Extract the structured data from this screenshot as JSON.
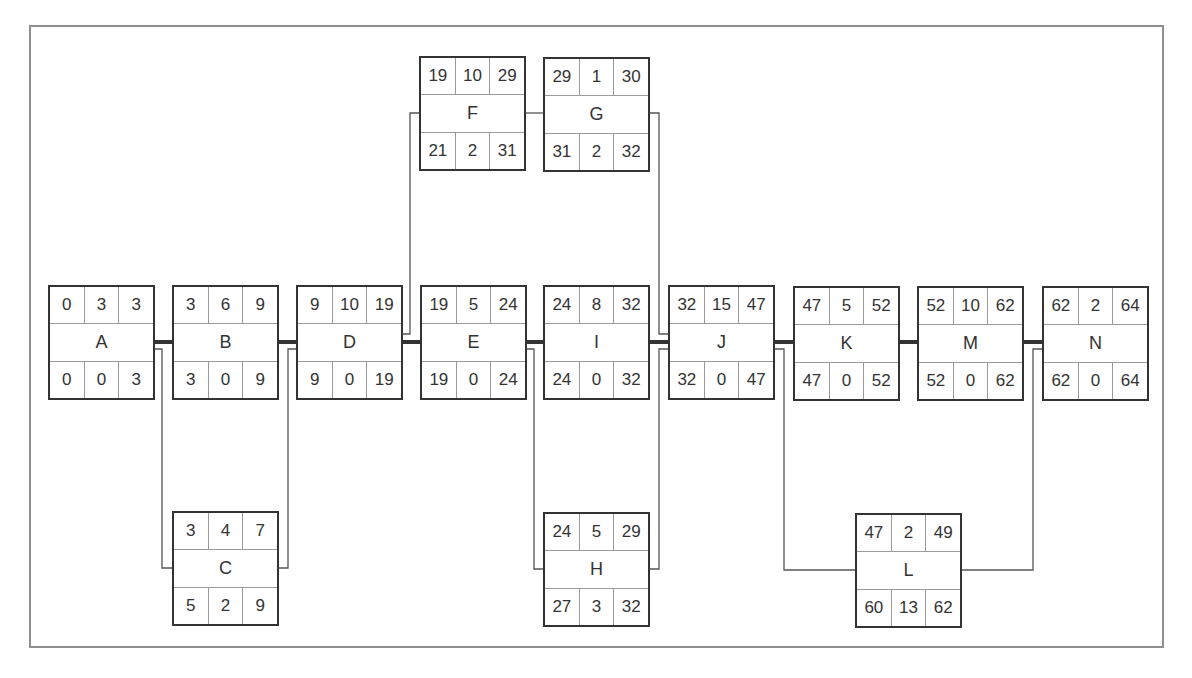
{
  "diagram": {
    "type": "activity-on-node network (critical path)",
    "cell_layout": {
      "top_row": [
        "early_start",
        "duration",
        "early_finish"
      ],
      "middle_row": "activity",
      "bottom_row": [
        "late_start",
        "total_float",
        "late_finish"
      ]
    },
    "colors": {
      "frame": "#8e8e8e",
      "node_border": "#333333",
      "cell_divider": "#9a9a9a",
      "critical_link": "#333333",
      "noncritical_link": "#555555"
    }
  },
  "nodes": {
    "A": {
      "label": "A",
      "es": "0",
      "dur": "3",
      "ef": "3",
      "ls": "0",
      "tf": "0",
      "lf": "3"
    },
    "B": {
      "label": "B",
      "es": "3",
      "dur": "6",
      "ef": "9",
      "ls": "3",
      "tf": "0",
      "lf": "9"
    },
    "C": {
      "label": "C",
      "es": "3",
      "dur": "4",
      "ef": "7",
      "ls": "5",
      "tf": "2",
      "lf": "9"
    },
    "D": {
      "label": "D",
      "es": "9",
      "dur": "10",
      "ef": "19",
      "ls": "9",
      "tf": "0",
      "lf": "19"
    },
    "E": {
      "label": "E",
      "es": "19",
      "dur": "5",
      "ef": "24",
      "ls": "19",
      "tf": "0",
      "lf": "24"
    },
    "F": {
      "label": "F",
      "es": "19",
      "dur": "10",
      "ef": "29",
      "ls": "21",
      "tf": "2",
      "lf": "31"
    },
    "G": {
      "label": "G",
      "es": "29",
      "dur": "1",
      "ef": "30",
      "ls": "31",
      "tf": "2",
      "lf": "32"
    },
    "H": {
      "label": "H",
      "es": "24",
      "dur": "5",
      "ef": "29",
      "ls": "27",
      "tf": "3",
      "lf": "32"
    },
    "I": {
      "label": "I",
      "es": "24",
      "dur": "8",
      "ef": "32",
      "ls": "24",
      "tf": "0",
      "lf": "32"
    },
    "J": {
      "label": "J",
      "es": "32",
      "dur": "15",
      "ef": "47",
      "ls": "32",
      "tf": "0",
      "lf": "47"
    },
    "K": {
      "label": "K",
      "es": "47",
      "dur": "5",
      "ef": "52",
      "ls": "47",
      "tf": "0",
      "lf": "52"
    },
    "L": {
      "label": "L",
      "es": "47",
      "dur": "2",
      "ef": "49",
      "ls": "60",
      "tf": "13",
      "lf": "62"
    },
    "M": {
      "label": "M",
      "es": "52",
      "dur": "10",
      "ef": "62",
      "ls": "52",
      "tf": "0",
      "lf": "62"
    },
    "N": {
      "label": "N",
      "es": "62",
      "dur": "2",
      "ef": "64",
      "ls": "62",
      "tf": "0",
      "lf": "64"
    }
  },
  "edges": [
    {
      "from": "A",
      "to": "B",
      "critical": true
    },
    {
      "from": "A",
      "to": "C",
      "critical": false
    },
    {
      "from": "B",
      "to": "D",
      "critical": true
    },
    {
      "from": "C",
      "to": "D",
      "critical": false
    },
    {
      "from": "D",
      "to": "E",
      "critical": true
    },
    {
      "from": "D",
      "to": "F",
      "critical": false
    },
    {
      "from": "F",
      "to": "G",
      "critical": false
    },
    {
      "from": "E",
      "to": "I",
      "critical": true
    },
    {
      "from": "E",
      "to": "H",
      "critical": false
    },
    {
      "from": "G",
      "to": "J",
      "critical": false
    },
    {
      "from": "I",
      "to": "J",
      "critical": true
    },
    {
      "from": "H",
      "to": "J",
      "critical": false
    },
    {
      "from": "J",
      "to": "K",
      "critical": true
    },
    {
      "from": "J",
      "to": "L",
      "critical": false
    },
    {
      "from": "K",
      "to": "M",
      "critical": true
    },
    {
      "from": "M",
      "to": "N",
      "critical": true
    },
    {
      "from": "L",
      "to": "N",
      "critical": false
    }
  ]
}
